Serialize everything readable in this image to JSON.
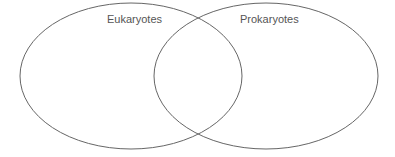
{
  "diagram": {
    "type": "venn",
    "sets": [
      {
        "label": "Eukaryotes"
      },
      {
        "label": "Prokaryotes"
      }
    ],
    "stroke_color": "#555555"
  }
}
